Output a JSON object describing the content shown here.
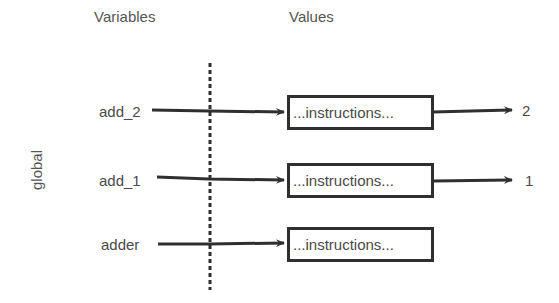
{
  "headers": {
    "variables": "Variables",
    "values": "Values"
  },
  "scope": {
    "label": "global"
  },
  "bindings": [
    {
      "name": "add_2",
      "value_box": "...instructions...",
      "returns": "2"
    },
    {
      "name": "add_1",
      "value_box": "...instructions...",
      "returns": "1"
    },
    {
      "name": "adder",
      "value_box": "...instructions...",
      "returns": null
    }
  ],
  "colors": {
    "stroke": "#2f2f2f",
    "text": "#4a4a4a",
    "background": "#ffffff"
  }
}
